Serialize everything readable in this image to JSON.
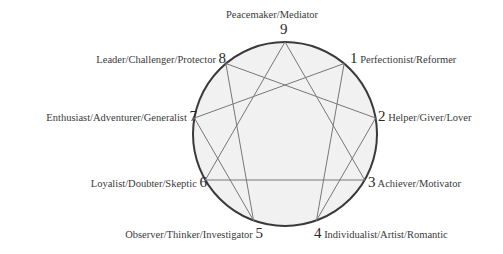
{
  "diagram": {
    "center": [
      285,
      134
    ],
    "radius": 92,
    "colors": {
      "circle_fill": "#f1f1f1",
      "circle_stroke": "#3a3a3a",
      "lines": "#777777",
      "text": "#3a3a3a"
    },
    "types": [
      {
        "number": "9",
        "name": "Peacemaker/Mediator"
      },
      {
        "number": "1",
        "name": "Perfectionist/Reformer"
      },
      {
        "number": "2",
        "name": "Helper/Giver/Lover"
      },
      {
        "number": "3",
        "name": "Achiever/Motivator"
      },
      {
        "number": "4",
        "name": "Individualist/Artist/Romantic"
      },
      {
        "number": "5",
        "name": "Observer/Thinker/Investigator"
      },
      {
        "number": "6",
        "name": "Loyalist/Doubter/Skeptic"
      },
      {
        "number": "7",
        "name": "Enthusiast/Adventurer/Generalist"
      },
      {
        "number": "8",
        "name": "Leader/Challenger/Protector"
      }
    ],
    "triangle": [
      "9",
      "3",
      "6"
    ],
    "hexad": [
      "1",
      "4",
      "2",
      "8",
      "5",
      "7"
    ]
  }
}
